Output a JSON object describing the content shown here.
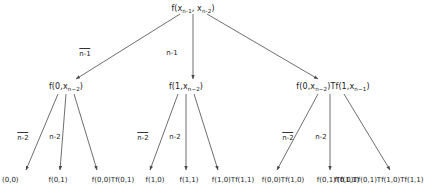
{
  "diagram": {
    "type": "recursion-tree",
    "title_present": false,
    "colors": {
      "ink": "#1b1b1b",
      "edge": "#4a4a4a",
      "background": "#ffffff"
    },
    "root": {
      "id": "root",
      "label": "f(xₙ₋₁, xₙ₋₂)",
      "parts": {
        "fn": "f(",
        "arg1": "x",
        "sub1": "n-1",
        "sep": ", ",
        "arg2": "x",
        "sub2": "n-2",
        "close": ")"
      },
      "x": 193,
      "y": 9
    },
    "level1": {
      "edge_labels": [
        {
          "text": "n-1",
          "overline": true,
          "x": 85,
          "y": 52
        },
        {
          "text": "n-1",
          "overline": false,
          "x": 172,
          "y": 52
        }
      ],
      "nodes": [
        {
          "id": "L",
          "label": "f(0, xₙ₋₂)",
          "x": 66,
          "y": 87,
          "parts": {
            "pre": "f(0, ",
            "arg": "x",
            "sub": "n-2",
            "post": ")"
          }
        },
        {
          "id": "M",
          "label": "f(1, xₙ₋₂)",
          "x": 186,
          "y": 87,
          "parts": {
            "pre": "f(1, ",
            "arg": "x",
            "sub": "n-2",
            "post": ")"
          }
        },
        {
          "id": "R",
          "label": "f(0, xₙ₋₂)Tf(1, xₙ₋₁)",
          "x": 333,
          "y": 87,
          "parts": {
            "pre": "f(0, ",
            "arg": "x",
            "sub": "n-2",
            "mid": ")Tf(1, ",
            "arg2": "x",
            "sub2": "n-1",
            "post": ")"
          }
        }
      ]
    },
    "level2": {
      "edge_labels": [
        {
          "text": "n-2",
          "overline": true,
          "x": 23,
          "y": 136
        },
        {
          "text": "n-2",
          "overline": false,
          "x": 55,
          "y": 136
        },
        {
          "text": "n-2",
          "overline": true,
          "x": 143,
          "y": 136
        },
        {
          "text": "n-2",
          "overline": false,
          "x": 175,
          "y": 136
        },
        {
          "text": "n-2",
          "overline": true,
          "x": 288,
          "y": 136
        },
        {
          "text": "n-2",
          "overline": false,
          "x": 321,
          "y": 136
        }
      ]
    },
    "leaves": [
      {
        "id": "l1",
        "label": "(0,0)",
        "x": 16,
        "y": 181,
        "parent": "L"
      },
      {
        "id": "l2",
        "label": "f(0,1)",
        "x": 58,
        "y": 181,
        "parent": "L"
      },
      {
        "id": "l3",
        "label": "f(0,0)Tf(0,1)",
        "x": 113,
        "y": 181,
        "parent": "L"
      },
      {
        "id": "l4",
        "label": "f(1,0)",
        "x": 155,
        "y": 181,
        "parent": "M"
      },
      {
        "id": "l5",
        "label": "f(1,1)",
        "x": 189,
        "y": 181,
        "parent": "M"
      },
      {
        "id": "l6",
        "label": "f(1,0)Tf(1,1)",
        "x": 233,
        "y": 181,
        "parent": "M"
      },
      {
        "id": "l7",
        "label": "f(0,0)Tf(1,0)",
        "x": 283,
        "y": 181,
        "parent": "R"
      },
      {
        "id": "l8",
        "label": "f(0,1)Tf(1,1)",
        "x": 338,
        "y": 181,
        "parent": "R"
      },
      {
        "id": "l9",
        "label": "f(0,0)Tf(0,1)Tf(1,0)Tf(1,1)",
        "x": 399,
        "y": 181,
        "parent": "R"
      }
    ],
    "edges": [
      {
        "from": "root",
        "to": "L",
        "x1": 180,
        "y1": 14,
        "x2": 76,
        "y2": 79
      },
      {
        "from": "root",
        "to": "M",
        "x1": 193,
        "y1": 14,
        "x2": 193,
        "y2": 79
      },
      {
        "from": "root",
        "to": "R",
        "x1": 207,
        "y1": 14,
        "x2": 318,
        "y2": 79
      },
      {
        "from": "L",
        "to": "l1",
        "x1": 58,
        "y1": 94,
        "x2": 26,
        "y2": 170
      },
      {
        "from": "L",
        "to": "l2",
        "x1": 66,
        "y1": 94,
        "x2": 60,
        "y2": 170
      },
      {
        "from": "L",
        "to": "l3",
        "x1": 74,
        "y1": 94,
        "x2": 97,
        "y2": 170
      },
      {
        "from": "M",
        "to": "l4",
        "x1": 178,
        "y1": 94,
        "x2": 150,
        "y2": 170
      },
      {
        "from": "M",
        "to": "l5",
        "x1": 186,
        "y1": 94,
        "x2": 186,
        "y2": 170
      },
      {
        "from": "M",
        "to": "l6",
        "x1": 194,
        "y1": 94,
        "x2": 218,
        "y2": 170
      },
      {
        "from": "R",
        "to": "l7",
        "x1": 318,
        "y1": 94,
        "x2": 277,
        "y2": 170
      },
      {
        "from": "R",
        "to": "l8",
        "x1": 330,
        "y1": 94,
        "x2": 330,
        "y2": 170
      },
      {
        "from": "R",
        "to": "l9",
        "x1": 344,
        "y1": 94,
        "x2": 390,
        "y2": 170
      }
    ]
  }
}
